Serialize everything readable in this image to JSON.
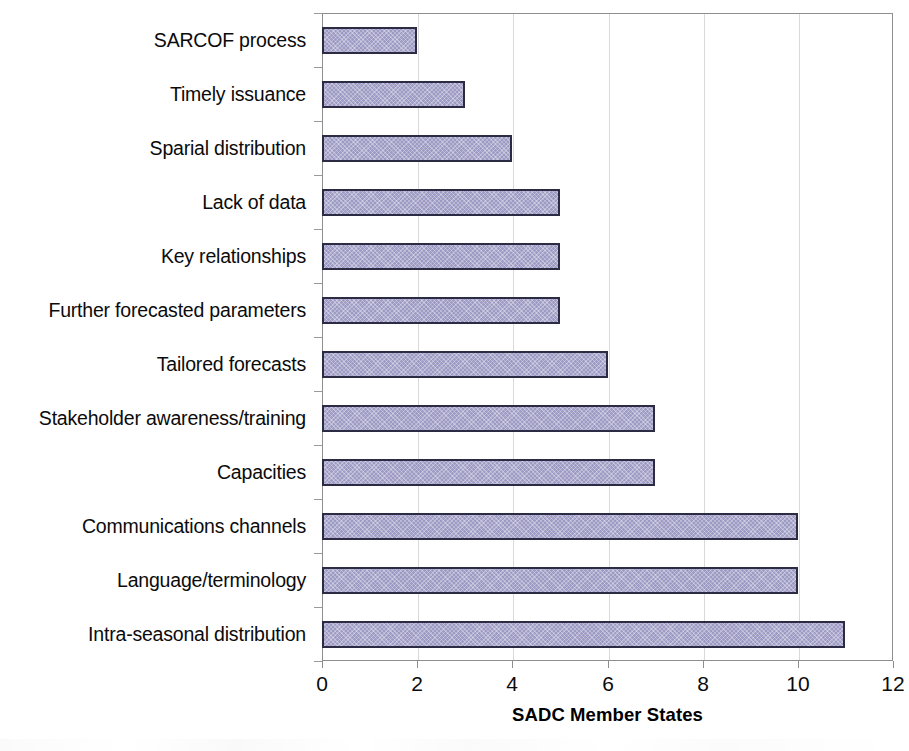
{
  "chart_data": {
    "type": "bar",
    "orientation": "horizontal",
    "title": "",
    "xlabel": "SADC Member States",
    "ylabel": "",
    "xlim": [
      0,
      12
    ],
    "ylim": null,
    "xticks": [
      0,
      2,
      4,
      6,
      8,
      10,
      12
    ],
    "xtick_labels": [
      "0",
      "2",
      "4",
      "6",
      "8",
      "10",
      "12"
    ],
    "grid": "vertical",
    "legend": null,
    "categories": [
      "SARCOF process",
      "Timely issuance",
      "Sparial distribution",
      "Lack of data",
      "Key relationships",
      "Further forecasted parameters",
      "Tailored forecasts",
      "Stakeholder awareness/training",
      "Capacities",
      "Communications channels",
      "Language/terminology",
      "Intra-seasonal distribution"
    ],
    "values": [
      2,
      3,
      4,
      5,
      5,
      5,
      6,
      7,
      7,
      10,
      10,
      11
    ],
    "series": [
      {
        "name": "SADC Member States",
        "values": [
          2,
          3,
          4,
          5,
          5,
          5,
          6,
          7,
          7,
          10,
          10,
          11
        ]
      }
    ],
    "colors": {
      "bar_fill": "#9d9bc4",
      "bar_border": "#2b2b44",
      "gridline": "#d9d9d9",
      "axis_line": "#8e8e8e",
      "text": "#0b0b0b",
      "background": "#ffffff"
    }
  }
}
